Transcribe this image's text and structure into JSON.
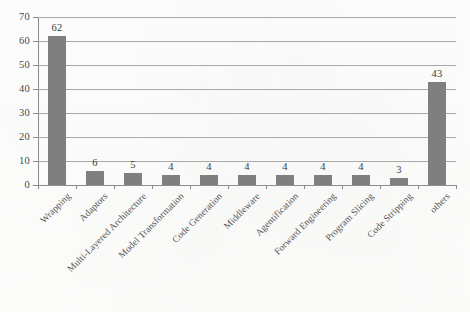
{
  "chart_data": {
    "type": "bar",
    "title": "",
    "subtitle": "",
    "xlabel": "",
    "ylabel": "",
    "ylim": [
      0,
      70
    ],
    "ytick_step": 10,
    "yticks": [
      0,
      10,
      20,
      30,
      40,
      50,
      60,
      70
    ],
    "ytick_labels": [
      "0",
      "10",
      "20",
      "30",
      "40",
      "50",
      "60",
      "70"
    ],
    "grid": true,
    "grid_axis": "y",
    "legend": false,
    "legend_position": "none",
    "orientation": "vertical",
    "bar_color": "#7f7f7f",
    "gridline_color": "#a9a9a9",
    "axis_color": "#8a8a8a",
    "label_rotation_deg": -45,
    "categories": [
      "Wrapping",
      "Adaptors",
      "Multi-Layered Architecture",
      "Model Transformation",
      "Code Generation",
      "Middleware",
      "Agentification",
      "Forward Engineering",
      "Program Slicing",
      "Code Stripping",
      "others"
    ],
    "values": [
      62,
      6,
      5,
      4,
      4,
      4,
      4,
      4,
      4,
      3,
      43
    ],
    "value_labels": [
      "62",
      "6",
      "5",
      "4",
      "4",
      "4",
      "4",
      "4",
      "4",
      "3",
      "43"
    ],
    "show_value_labels": true
  }
}
